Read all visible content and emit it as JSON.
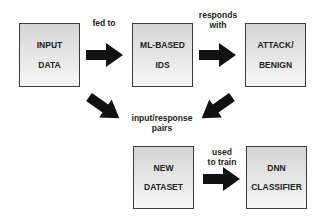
{
  "nodes": {
    "input_data": {
      "line1": "INPUT",
      "line2": "DATA"
    },
    "ml_ids": {
      "line1": "ML-BASED",
      "line2": "IDS"
    },
    "attack_benign": {
      "line1": "ATTACK/",
      "line2": "BENIGN"
    },
    "new_dataset": {
      "line1": "NEW",
      "line2": "DATASET"
    },
    "dnn_classifier": {
      "line1": "DNN",
      "line2": "CLASSIFIER"
    }
  },
  "edges": {
    "fed_to": "fed to",
    "responds_line1": "responds",
    "responds_line2": "with",
    "pairs_line1": "input/response",
    "pairs_line2": "pairs",
    "used_line1": "used",
    "used_line2": "to train"
  },
  "colors": {
    "arrow": "#111111",
    "border": "#3a3a3a"
  }
}
